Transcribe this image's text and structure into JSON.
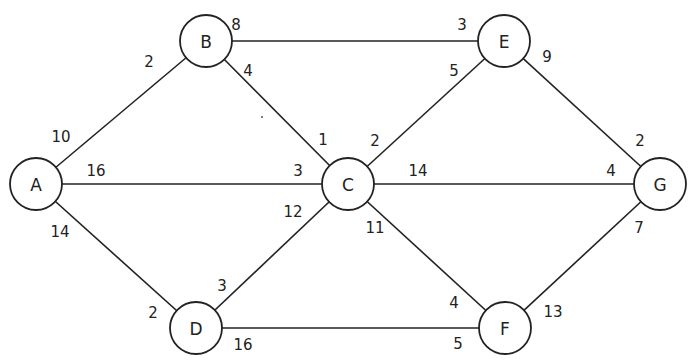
{
  "diagram": {
    "type": "weighted-graph",
    "node_radius": 26,
    "nodes": [
      {
        "id": "A",
        "label": "A",
        "x": 36,
        "y": 184
      },
      {
        "id": "B",
        "label": "B",
        "x": 206,
        "y": 41
      },
      {
        "id": "C",
        "label": "C",
        "x": 348,
        "y": 184
      },
      {
        "id": "D",
        "label": "D",
        "x": 196,
        "y": 328
      },
      {
        "id": "E",
        "label": "E",
        "x": 504,
        "y": 41
      },
      {
        "id": "F",
        "label": "F",
        "x": 505,
        "y": 328
      },
      {
        "id": "G",
        "label": "G",
        "x": 660,
        "y": 184
      }
    ],
    "edges": [
      {
        "from": "A",
        "to": "B",
        "labels": [
          {
            "text": "10",
            "x": 61,
            "y": 137
          },
          {
            "text": "2",
            "x": 149,
            "y": 62
          }
        ]
      },
      {
        "from": "A",
        "to": "C",
        "labels": [
          {
            "text": "16",
            "x": 96,
            "y": 171
          },
          {
            "text": "3",
            "x": 298,
            "y": 171
          }
        ]
      },
      {
        "from": "A",
        "to": "D",
        "labels": [
          {
            "text": "14",
            "x": 60,
            "y": 232
          },
          {
            "text": "2",
            "x": 153,
            "y": 313
          }
        ]
      },
      {
        "from": "B",
        "to": "E",
        "labels": [
          {
            "text": "8",
            "x": 236,
            "y": 25
          },
          {
            "text": "3",
            "x": 462,
            "y": 25
          }
        ]
      },
      {
        "from": "B",
        "to": "C",
        "labels": [
          {
            "text": "4",
            "x": 248,
            "y": 71
          },
          {
            "text": "1",
            "x": 323,
            "y": 140
          }
        ]
      },
      {
        "from": "C",
        "to": "E",
        "labels": [
          {
            "text": "2",
            "x": 375,
            "y": 141
          },
          {
            "text": "5",
            "x": 454,
            "y": 71
          }
        ]
      },
      {
        "from": "C",
        "to": "G",
        "labels": [
          {
            "text": "14",
            "x": 418,
            "y": 171
          },
          {
            "text": "4",
            "x": 611,
            "y": 171
          }
        ]
      },
      {
        "from": "C",
        "to": "D",
        "labels": [
          {
            "text": "12",
            "x": 293,
            "y": 212
          },
          {
            "text": "3",
            "x": 222,
            "y": 286
          }
        ]
      },
      {
        "from": "C",
        "to": "F",
        "labels": [
          {
            "text": "11",
            "x": 375,
            "y": 228
          },
          {
            "text": "4",
            "x": 454,
            "y": 303
          }
        ]
      },
      {
        "from": "E",
        "to": "G",
        "labels": [
          {
            "text": "9",
            "x": 547,
            "y": 57
          },
          {
            "text": "2",
            "x": 640,
            "y": 141
          }
        ]
      },
      {
        "from": "G",
        "to": "F",
        "labels": [
          {
            "text": "7",
            "x": 639,
            "y": 228
          },
          {
            "text": "13",
            "x": 553,
            "y": 312
          }
        ]
      },
      {
        "from": "D",
        "to": "F",
        "labels": [
          {
            "text": "16",
            "x": 243,
            "y": 345
          },
          {
            "text": "5",
            "x": 458,
            "y": 344
          }
        ]
      }
    ]
  }
}
